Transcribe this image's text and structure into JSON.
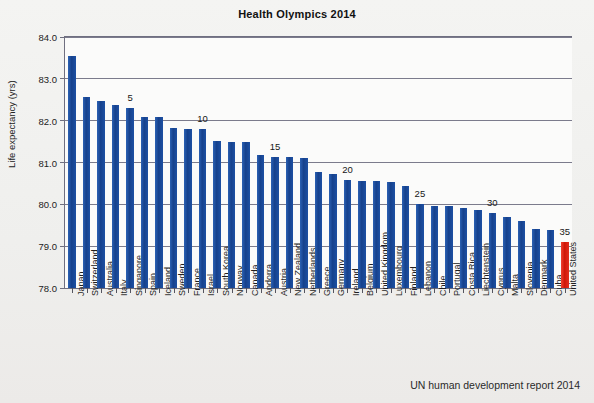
{
  "chart_data": {
    "type": "bar",
    "title": "Health Olympics 2014",
    "xlabel": "",
    "ylabel": "Life expectancy (yrs)",
    "ylim": [
      78.0,
      84.0
    ],
    "ytick_labels": [
      "84.0",
      "83.0",
      "82.0",
      "81.0",
      "80.0",
      "79.0",
      "78.0"
    ],
    "yticks": [
      84.0,
      83.0,
      82.0,
      81.0,
      80.0,
      79.0,
      78.0
    ],
    "grid": true,
    "legend": "none",
    "source_note": "UN human development report 2014",
    "highlight_color": "#e22a1b",
    "bar_color": "#1f4fa0",
    "rank_annotations": [
      {
        "rank": 5,
        "label": "5"
      },
      {
        "rank": 10,
        "label": "10"
      },
      {
        "rank": 15,
        "label": "15"
      },
      {
        "rank": 20,
        "label": "20"
      },
      {
        "rank": 25,
        "label": "25"
      },
      {
        "rank": 30,
        "label": "30"
      },
      {
        "rank": 35,
        "label": "35"
      }
    ],
    "categories": [
      "Japan",
      "Switzerland",
      "Australia",
      "Italy",
      "Singapore",
      "Spain",
      "Iceland",
      "Sweden",
      "France",
      "Israel",
      "South Korea",
      "Norway",
      "Canada",
      "Andorra",
      "Austria",
      "New Zealand",
      "Netherlands",
      "Greece",
      "Germany",
      "Ireland",
      "Belgium",
      "United Kingdom",
      "Luxembourg",
      "Finland",
      "Lebanon",
      "Chile",
      "Portugal",
      "Costa Rica",
      "Liechtenstein",
      "Cyprus",
      "Malta",
      "Slovenia",
      "Denmark",
      "Cuba",
      "United States"
    ],
    "values": [
      83.55,
      82.57,
      82.47,
      82.37,
      82.31,
      82.08,
      82.08,
      81.82,
      81.8,
      81.8,
      81.52,
      81.5,
      81.48,
      81.17,
      81.13,
      81.12,
      81.1,
      80.77,
      80.73,
      80.59,
      80.55,
      80.55,
      80.53,
      80.45,
      80.0,
      79.97,
      79.95,
      79.92,
      79.87,
      79.8,
      79.7,
      79.6,
      79.4,
      79.39,
      79.1
    ],
    "highlight_index": 34
  }
}
